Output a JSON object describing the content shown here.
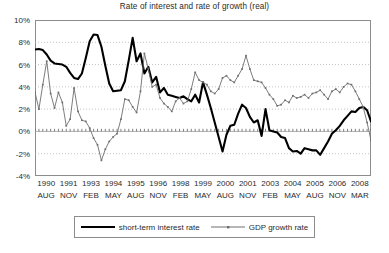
{
  "chart_data": {
    "type": "line",
    "title": "Rate of interest and rate of growth (real)",
    "xlabel": "",
    "ylabel": "",
    "ylim": [
      -4,
      10
    ],
    "yticks": [
      "10%",
      "8%",
      "6%",
      "4%",
      "2%",
      "0%",
      "-2%",
      "-4%"
    ],
    "ytick_values": [
      10,
      8,
      6,
      4,
      2,
      0,
      -2,
      -4
    ],
    "grid": true,
    "grid_style": "dotted horizontal",
    "legend_position": "bottom-center",
    "xtick_labels": [
      {
        "year": "1990",
        "month": "AUG"
      },
      {
        "year": "1991",
        "month": "NOV"
      },
      {
        "year": "1993",
        "month": "FEB"
      },
      {
        "year": "1994",
        "month": "MAY"
      },
      {
        "year": "1995",
        "month": "AUG"
      },
      {
        "year": "1996",
        "month": "NOV"
      },
      {
        "year": "1998",
        "month": "FEB"
      },
      {
        "year": "1999",
        "month": "MAY"
      },
      {
        "year": "2000",
        "month": "AUG"
      },
      {
        "year": "2001",
        "month": "NOV"
      },
      {
        "year": "2003",
        "month": "FEB"
      },
      {
        "year": "2004",
        "month": "MAY"
      },
      {
        "year": "2005",
        "month": "AUG"
      },
      {
        "year": "2006",
        "month": "NOV"
      },
      {
        "year": "2008",
        "month": "MAR"
      }
    ],
    "x_index_range": [
      0,
      74
    ],
    "series": [
      {
        "name": "short-term interest rate",
        "color": "#000000",
        "line_width": 2.1,
        "markers": false,
        "values": [
          7.35,
          7.4,
          7.3,
          6.9,
          6.35,
          6.1,
          6.05,
          6.0,
          5.8,
          5.25,
          4.8,
          4.7,
          5.2,
          6.6,
          8.1,
          8.7,
          8.65,
          7.6,
          5.9,
          4.3,
          3.6,
          3.65,
          3.7,
          4.5,
          6.4,
          8.4,
          6.3,
          7.0,
          5.2,
          5.8,
          4.4,
          4.9,
          3.5,
          3.9,
          3.3,
          3.2,
          3.1,
          3.0,
          3.15,
          2.9,
          2.7,
          3.3,
          2.6,
          4.4,
          3.3,
          2.1,
          0.8,
          -0.5,
          -1.8,
          -0.3,
          0.5,
          0.6,
          1.6,
          2.4,
          2.1,
          1.3,
          0.8,
          1.0,
          -0.4,
          2.0,
          0.1,
          0.0,
          -0.1,
          -0.5,
          -0.6,
          -1.5,
          -1.8,
          -1.75,
          -2.0,
          -1.5,
          -1.6,
          -1.7,
          -1.7,
          -2.1,
          -1.5,
          -0.9,
          -0.2,
          0.1,
          0.5,
          1.0,
          1.4,
          1.8,
          1.75,
          2.1,
          2.2,
          1.9,
          0.9
        ]
      },
      {
        "name": "GDP growth rate",
        "color": "#6e6e6e",
        "line_width": 0.9,
        "markers": true,
        "values": [
          3.5,
          2.0,
          4.2,
          6.3,
          3.4,
          2.1,
          3.5,
          2.6,
          0.5,
          1.1,
          3.9,
          1.8,
          1.0,
          0.9,
          0.3,
          -0.6,
          -1.2,
          -2.6,
          -1.6,
          -0.9,
          -0.5,
          -0.2,
          1.1,
          2.9,
          2.8,
          2.2,
          1.7,
          3.6,
          7.0,
          5.6,
          4.0,
          4.2,
          3.0,
          2.5,
          2.2,
          1.8,
          2.7,
          3.0,
          2.5,
          2.7,
          3.8,
          5.3,
          4.6,
          4.4,
          4.2,
          3.6,
          3.4,
          3.8,
          4.8,
          5.0,
          4.6,
          4.4,
          5.0,
          5.6,
          6.8,
          5.6,
          4.6,
          4.5,
          4.4,
          3.9,
          3.3,
          2.9,
          2.3,
          2.4,
          2.8,
          2.6,
          3.2,
          3.0,
          3.1,
          3.3,
          3.0,
          3.4,
          3.5,
          3.7,
          3.3,
          2.9,
          3.6,
          3.8,
          3.5,
          4.0,
          4.3,
          4.2,
          3.6,
          2.9,
          2.2,
          0.8,
          -0.8
        ]
      }
    ]
  },
  "legend": {
    "entries": [
      {
        "label": "short-term interest rate",
        "style": "thick-black-line"
      },
      {
        "label": "GDP growth rate",
        "style": "thin-gray-line-with-markers"
      }
    ]
  }
}
